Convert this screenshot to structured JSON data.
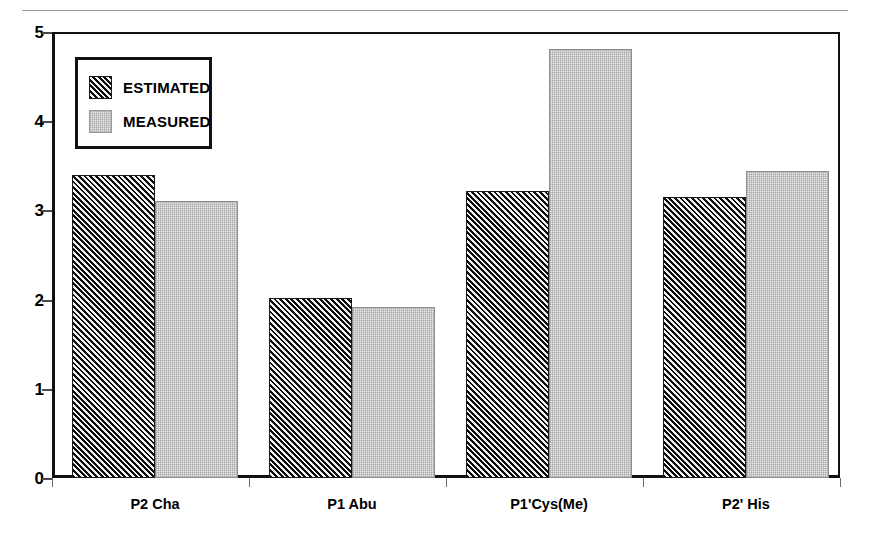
{
  "chart_data": {
    "type": "bar",
    "title": "",
    "xlabel": "",
    "ylabel": "",
    "categories": [
      "P2 Cha",
      "P1 Abu",
      "P1'Cys(Me)",
      "P2' His"
    ],
    "series": [
      {
        "name": "ESTIMATED",
        "values": [
          3.4,
          2.02,
          3.22,
          3.15
        ]
      },
      {
        "name": "MEASURED",
        "values": [
          3.1,
          1.92,
          4.81,
          3.44
        ]
      }
    ],
    "ylim": [
      0,
      5
    ],
    "yticks": [
      "0",
      "1",
      "2",
      "3",
      "4",
      "5"
    ],
    "ytick_values": [
      0,
      1,
      2,
      3,
      4,
      5
    ],
    "grid": false,
    "legend_position": "upper-left"
  },
  "legend": {
    "items": [
      {
        "label": "ESTIMATED",
        "swatch": "hatched-diagonal-swatch"
      },
      {
        "label": "MEASURED",
        "swatch": "light-gray-swatch"
      }
    ]
  }
}
